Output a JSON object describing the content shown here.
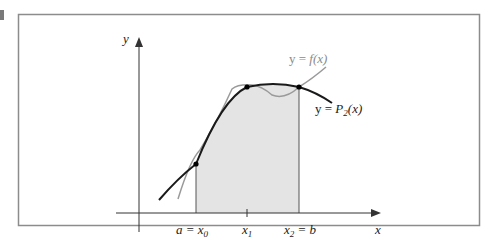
{
  "figure": {
    "axis_labels": {
      "x": "x",
      "y": "y"
    },
    "curve_labels": {
      "f": {
        "prefix": "y = ",
        "name": "f(x)"
      },
      "p2": {
        "prefix": "y = ",
        "name": "P",
        "sub": "2",
        "suffix": "(x)"
      }
    },
    "tick_labels": [
      {
        "main": "a = x",
        "sub": "0",
        "after": ""
      },
      {
        "main": "x",
        "sub": "1",
        "after": ""
      },
      {
        "main": "x",
        "sub": "2",
        "after": " = b"
      }
    ],
    "colors": {
      "frame": "#8c8c8c",
      "axes": "#333333",
      "p2_curve": "#1a1a1a",
      "f_curve": "#9a9a9a",
      "shade": "#e4e4e4",
      "points": "#000000"
    }
  }
}
